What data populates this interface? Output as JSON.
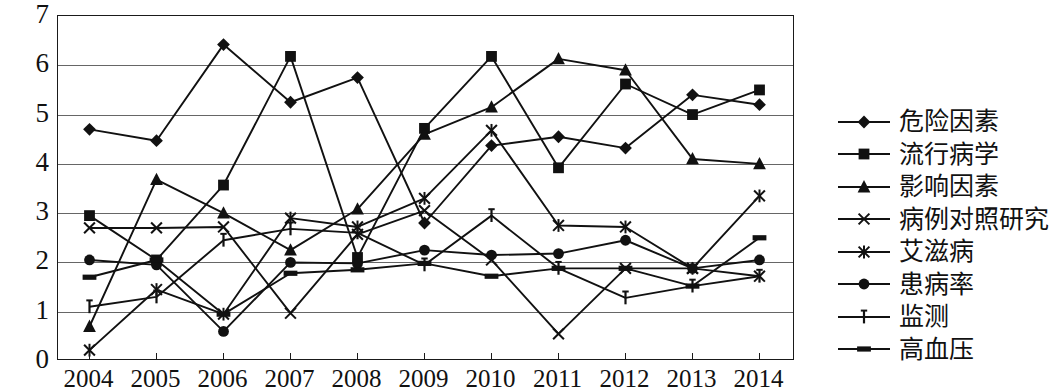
{
  "chart_data": {
    "type": "line",
    "title": "",
    "xlabel": "",
    "ylabel": "",
    "ylim": [
      0,
      7
    ],
    "yticks": [
      0,
      1,
      2,
      3,
      4,
      5,
      6,
      7
    ],
    "grid": true,
    "legend_position": "right",
    "categories": [
      "2004",
      "2005",
      "2006",
      "2007",
      "2008",
      "2009",
      "2010",
      "2011",
      "2012",
      "2013",
      "2014"
    ],
    "series": [
      {
        "name": "危险因素",
        "marker": "diamond",
        "values": [
          4.7,
          4.47,
          6.42,
          5.25,
          5.75,
          2.8,
          4.37,
          4.55,
          4.32,
          5.4,
          5.2
        ]
      },
      {
        "name": "流行病学",
        "marker": "square",
        "values": [
          2.95,
          2.05,
          3.57,
          6.18,
          2.1,
          4.72,
          6.18,
          3.92,
          5.62,
          5.0,
          5.5
        ]
      },
      {
        "name": "影响因素",
        "marker": "triangle",
        "values": [
          0.7,
          3.68,
          3.0,
          2.25,
          3.08,
          4.6,
          5.15,
          6.13,
          5.9,
          4.1,
          4.0
        ]
      },
      {
        "name": "病例对照研究",
        "marker": "x",
        "values": [
          2.7,
          2.7,
          2.72,
          0.97,
          2.57,
          3.05,
          2.05,
          0.55,
          1.88,
          1.88,
          1.72
        ]
      },
      {
        "name": "艾滋病",
        "marker": "asterisk",
        "values": [
          0.22,
          1.45,
          0.95,
          2.9,
          2.72,
          3.3,
          4.68,
          2.75,
          2.72,
          1.88,
          3.35
        ]
      },
      {
        "name": "患病率",
        "marker": "circle",
        "values": [
          2.05,
          1.95,
          0.6,
          2.0,
          1.98,
          2.25,
          2.15,
          2.18,
          2.45,
          1.88,
          2.05
        ]
      },
      {
        "name": "监测",
        "marker": "plus",
        "values": [
          1.1,
          1.3,
          2.45,
          2.68,
          2.6,
          1.95,
          2.95,
          1.88,
          1.28,
          1.52,
          1.72
        ]
      },
      {
        "name": "高血压",
        "marker": "bar",
        "values": [
          1.7,
          2.05,
          0.95,
          1.78,
          1.85,
          1.98,
          1.72,
          1.88,
          1.88,
          1.52,
          2.5
        ]
      }
    ]
  },
  "axes": {
    "y_tick_labels": [
      "7",
      "6",
      "5",
      "4",
      "3",
      "2",
      "1",
      "0"
    ],
    "x_tick_labels": [
      "2004",
      "2005",
      "2006",
      "2007",
      "2008",
      "2009",
      "2010",
      "2011",
      "2012",
      "2013",
      "2014"
    ]
  },
  "legend": {
    "items": [
      {
        "label": "危险因素",
        "marker": "diamond"
      },
      {
        "label": "流行病学",
        "marker": "square"
      },
      {
        "label": "影响因素",
        "marker": "triangle"
      },
      {
        "label": "病例对照研究",
        "marker": "x"
      },
      {
        "label": "艾滋病",
        "marker": "asterisk"
      },
      {
        "label": "患病率",
        "marker": "circle"
      },
      {
        "label": "监测",
        "marker": "plus"
      },
      {
        "label": "高血压",
        "marker": "bar"
      }
    ]
  },
  "colors": {
    "line": "#111111",
    "grid": "#666666",
    "frame": "#1a1a1a",
    "text": "#111111",
    "background": "#ffffff"
  }
}
